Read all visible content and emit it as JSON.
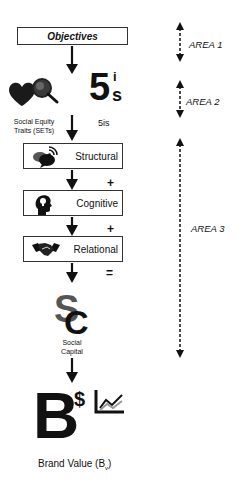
{
  "objectives": {
    "label": "Objectives"
  },
  "sets": {
    "label_line1": "Social Equity",
    "label_line2": "Traits (SETs)",
    "icon": "heart-magnifier-icon"
  },
  "five_is": {
    "big": "5",
    "sup": "i",
    "sub": "s",
    "label": "5is"
  },
  "steps": [
    {
      "label": "Structural",
      "icon": "chat-bubbles-wifi-icon"
    },
    {
      "label": "Cognitive",
      "icon": "head-lightbulb-icon"
    },
    {
      "label": "Relational",
      "icon": "handshake-icon"
    }
  ],
  "operators": {
    "plus1": "+",
    "plus2": "+",
    "equals": "="
  },
  "social_capital": {
    "logo": "SC",
    "label_line1": "Social",
    "label_line2": "Capital"
  },
  "brand_value": {
    "big": "B",
    "dollar": "$",
    "label": "Brand Value (B",
    "label_sub": "v",
    "label_end": ")"
  },
  "areas": [
    {
      "label": "AREA 1"
    },
    {
      "label": "AREA 2"
    },
    {
      "label": "AREA 3"
    }
  ]
}
